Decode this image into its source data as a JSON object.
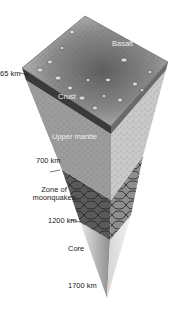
{
  "diagram": {
    "layers": [
      {
        "name": "Basalt",
        "label": "Basalt"
      },
      {
        "name": "Crust",
        "label": "Crust"
      },
      {
        "name": "Upper mantle",
        "label": "Upper mantle"
      },
      {
        "name": "Zone of moonquakes",
        "label_line1": "Zone of",
        "label_line2": "moonquakes"
      },
      {
        "name": "Core",
        "label": "Core"
      }
    ],
    "depths": {
      "crust_base": "65 km",
      "mantle_base": "700 km",
      "moonquake_base": "1200 km",
      "center": "1700 km"
    },
    "depth_labels": {
      "d65": "65 km",
      "d700": "700 km",
      "d1200": "1200 km",
      "d1700": "1700 km"
    },
    "colors": {
      "basalt_top": "#8a8a8a",
      "crust": "#3a3a3a",
      "mantle_left": "#9a9a9a",
      "mantle_right": "#c8c8c8",
      "moonquake_left": "#555555",
      "moonquake_right": "#8c8c8c",
      "core": "#b0b0b0"
    }
  }
}
